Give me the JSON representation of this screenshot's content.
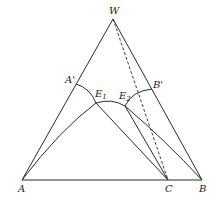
{
  "diagram": {
    "type": "ternary-phase-diagram",
    "vertices": {
      "W": {
        "label": "W"
      },
      "A": {
        "label": "A"
      },
      "B": {
        "label": "B"
      },
      "C": {
        "label": "C"
      }
    },
    "points": {
      "A_prime": {
        "label": "A'"
      },
      "B_prime": {
        "label": "B'"
      },
      "E1": {
        "label": "E",
        "subscript": "1"
      },
      "E2": {
        "label": "E",
        "subscript": "2"
      }
    },
    "colors": {
      "line": "#2a2a2a",
      "background": "#ffffff"
    }
  }
}
